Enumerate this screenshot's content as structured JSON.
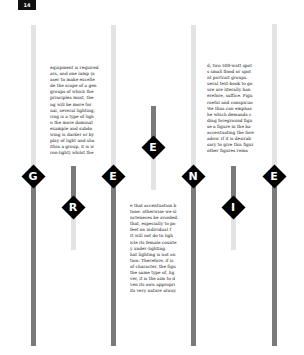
{
  "page": {
    "number": "14",
    "background": "#ffffff",
    "colors": {
      "bar_light": "#e3e3e3",
      "bar_dark": "#7a7a7a",
      "diamond": "#000000",
      "letter": "#ffffff"
    }
  },
  "markers": [
    {
      "letter": "G",
      "column": 1
    },
    {
      "letter": "R",
      "column": 1.5
    },
    {
      "letter": "E",
      "column": 2
    },
    {
      "letter": "E",
      "column": 2.5
    },
    {
      "letter": "N",
      "column": 3
    },
    {
      "letter": "I",
      "column": 3.5
    },
    {
      "letter": "E",
      "column": 4
    }
  ],
  "text_blocks": [
    {
      "lines": [
        "equipment is required",
        "ars, and one lamp (a",
        "aser to make excelle",
        "de the scope of a gen",
        "groups of which the",
        "principles must, the",
        "ng will be more for",
        "ual, several lighting,",
        "ring is a type of ligh",
        "n the more dominat",
        "example and subdo",
        "wing is darker or by",
        "play of light and sha",
        "ithin a group, it is w",
        "ron-light) whilst the"
      ]
    },
    {
      "lines": [
        "d; two 500-watt spot",
        "s small flood or spot",
        "nt portrait groups.",
        "ueral text-book to go",
        "ure are literally han",
        "erefore, suffice. Figu",
        "roeful and conspicuo",
        "We thus can emphas",
        "he which demands c",
        "ding foreground figu",
        "se a figure in the ba",
        "accentuating the fore",
        "adow. If it is desirab",
        "sary to give this figur",
        "other figures rema"
      ]
    },
    {
      "lines": [
        "e that accentuation b",
        "tone: otherwise we sl",
        "ncteneces be avoided.",
        "that, especially to po",
        "feet on individual f",
        "It will not do to ligh",
        "icle its female counte",
        "y under-lighting.",
        "hat lighting is not on",
        "tion. Therefore, if is",
        "of character, the figu",
        "the same type of, lig",
        "ver, it is the aim to d",
        "ven its own appropri",
        "its very nature alway"
      ]
    }
  ]
}
